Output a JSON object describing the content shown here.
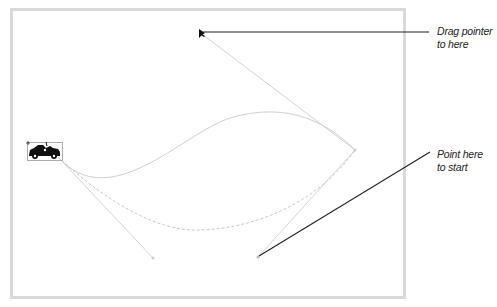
{
  "canvas": {
    "border_color": "#d9d9d9",
    "background": "#ffffff"
  },
  "objects": {
    "car_icon": "car-icon",
    "pointer_icon": "arrow-pointer-icon"
  },
  "callouts": {
    "drag": {
      "line1": "Drag pointer",
      "line2": "to here"
    },
    "start": {
      "line1": "Point here",
      "line2": "to start"
    }
  },
  "colors": {
    "curve": "#cfcfcf",
    "handle": "#d4d4d4",
    "callout_line": "#222222"
  }
}
